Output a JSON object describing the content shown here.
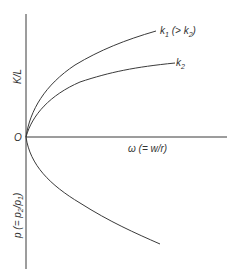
{
  "diagram": {
    "origin_label": "O",
    "y_axis_upper_label": "K/L",
    "y_axis_lower_label_prefix": "p (= p",
    "y_axis_lower_label_sub1": "2",
    "y_axis_lower_label_mid": "/p",
    "y_axis_lower_label_sub2": "1",
    "y_axis_lower_label_suffix": ")",
    "x_axis_label": "ω (= w/r)",
    "curves": [
      {
        "id": "k1",
        "label_main": "k",
        "label_sub": "1",
        "label_rest": " (> k",
        "label_sub2": "2",
        "label_end": ")"
      },
      {
        "id": "k2",
        "label_main": "k",
        "label_sub": "2"
      },
      {
        "id": "p",
        "description": "relative price curve below axis"
      }
    ],
    "colors": {
      "line": "#3a3a3a",
      "text": "#333333",
      "background": "#ffffff"
    }
  }
}
